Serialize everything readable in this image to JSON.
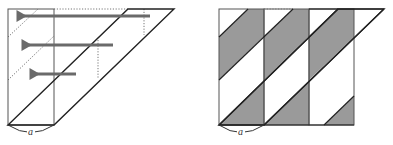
{
  "figure": {
    "colors": {
      "background": "#ffffff",
      "outline": "#222222",
      "rect_edge": "#555555",
      "arrow": "#6a6a6a",
      "dotted": "#777777",
      "shade": "#9a9a9a"
    },
    "left_panel": {
      "label": "a",
      "arrows": [
        {
          "y": 16,
          "x_start": 150,
          "x_end": 20
        },
        {
          "y": 45,
          "x_start": 113,
          "x_end": 25
        },
        {
          "y": 74,
          "x_start": 76,
          "x_end": 33
        }
      ]
    },
    "right_panel": {
      "label": "a",
      "strip_count": 3
    }
  }
}
